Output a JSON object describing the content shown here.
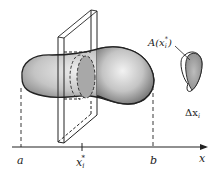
{
  "figure": {
    "axis": {
      "label": "x",
      "ticks": [
        {
          "label": "a",
          "x": 21
        },
        {
          "label": "x_i*",
          "x": 82
        },
        {
          "label": "b",
          "x": 153
        }
      ]
    },
    "labels": {
      "a": "a",
      "b": "b",
      "x": "x",
      "xi_base": "x",
      "xi_sub": "i",
      "xi_sup": "*",
      "area_prefix": "A(x",
      "area_sub": "i",
      "area_sup": "*",
      "area_suffix": ")",
      "delta_prefix": "Δx",
      "delta_sub": "i"
    },
    "colors": {
      "ink": "#222222",
      "shade": "#9a9a9a",
      "background": "#ffffff"
    }
  }
}
